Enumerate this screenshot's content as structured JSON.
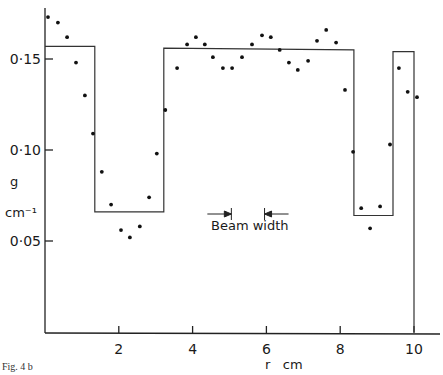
{
  "figure": {
    "caption": "Fig. 4 b"
  },
  "chart_data": {
    "type": "scatter",
    "title": "",
    "xlabel": "r   cm",
    "ylabel": "g",
    "ylabel_unit": "cm⁻¹",
    "xlim": [
      0,
      10.6
    ],
    "ylim": [
      0,
      0.175
    ],
    "grid": false,
    "x_ticks": [
      2,
      4,
      6,
      8,
      10
    ],
    "x_tick_labels": [
      "2",
      "4",
      "6",
      "8",
      "10"
    ],
    "y_ticks": [
      0.05,
      0.1,
      0.15
    ],
    "y_tick_labels": [
      "0·05",
      "0·10",
      "0·15"
    ],
    "annotation": {
      "text": "Beam width",
      "arrow_left_r": 5.05,
      "arrow_right_r": 5.95,
      "g": 0.068
    },
    "series": [
      {
        "name": "measured",
        "kind": "points",
        "x": [
          0.08,
          0.35,
          0.6,
          0.84,
          1.08,
          1.3,
          1.54,
          1.79,
          2.06,
          2.3,
          2.57,
          2.82,
          3.03,
          3.26,
          3.58,
          3.85,
          4.09,
          4.33,
          4.55,
          4.82,
          5.07,
          5.34,
          5.61,
          5.88,
          6.12,
          6.36,
          6.61,
          6.85,
          7.13,
          7.37,
          7.62,
          7.89,
          8.13,
          8.35,
          8.57,
          8.81,
          9.08,
          9.35,
          9.59,
          9.83,
          10.08
        ],
        "y": [
          0.173,
          0.17,
          0.162,
          0.148,
          0.13,
          0.109,
          0.088,
          0.07,
          0.056,
          0.052,
          0.058,
          0.074,
          0.098,
          0.122,
          0.145,
          0.158,
          0.162,
          0.158,
          0.151,
          0.145,
          0.145,
          0.151,
          0.158,
          0.163,
          0.162,
          0.155,
          0.148,
          0.144,
          0.149,
          0.16,
          0.166,
          0.159,
          0.133,
          0.099,
          0.068,
          0.057,
          0.069,
          0.103,
          0.145,
          0.132,
          0.129
        ]
      },
      {
        "name": "step model",
        "kind": "step",
        "x": [
          0,
          1.35,
          1.35,
          3.22,
          3.22,
          8.37,
          8.37,
          9.43,
          9.43,
          10.0,
          10.0
        ],
        "y": [
          0.157,
          0.157,
          0.066,
          0.066,
          0.156,
          0.155,
          0.064,
          0.064,
          0.154,
          0.154,
          0
        ]
      }
    ]
  }
}
